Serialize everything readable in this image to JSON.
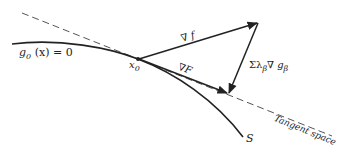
{
  "diagram": {
    "labels": {
      "constraint": "g",
      "constraint_sub": "0",
      "constraint_rest": "(x) = 0",
      "point": "x",
      "point_sub": "0",
      "grad_f": "∇ f",
      "grad_F": "∇F",
      "lagrange_sum": "Σλ",
      "lagrange_sub1": "β",
      "lagrange_mid": "∇ g",
      "lagrange_sub2": "β",
      "tangent_space": "Tangent space",
      "surface": "S"
    },
    "colors": {
      "stroke": "#222222",
      "dashed": "#555555"
    }
  }
}
